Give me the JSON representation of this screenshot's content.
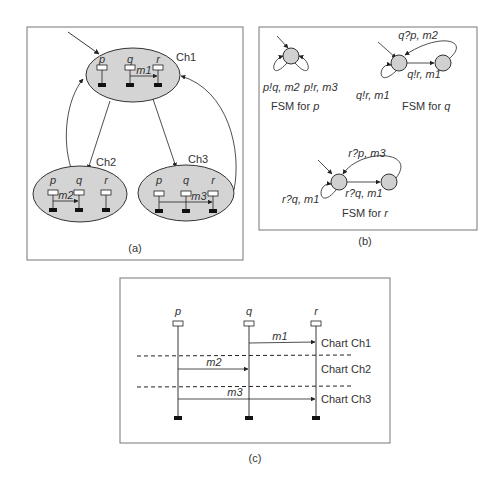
{
  "panel_a": {
    "caption": "(a)",
    "charts": [
      {
        "name": "Ch1",
        "lifelines": [
          "p",
          "q",
          "r"
        ],
        "message": "m1"
      },
      {
        "name": "Ch2",
        "lifelines": [
          "p",
          "q",
          "r"
        ],
        "message": "m2"
      },
      {
        "name": "Ch3",
        "lifelines": [
          "p",
          "q",
          "r"
        ],
        "message": "m3"
      }
    ]
  },
  "panel_b": {
    "caption": "(b)",
    "fsm_p": {
      "title_prefix": "FSM for ",
      "title_var": "p",
      "loop1": "p!q, m2",
      "loop2": "p!r, m3"
    },
    "fsm_q": {
      "title_prefix": "FSM for ",
      "title_var": "q",
      "loop": "q!r, m1",
      "forward": "q!r, m1",
      "back": "q?p, m2"
    },
    "fsm_r": {
      "title_prefix": "FSM for ",
      "title_var": "r",
      "loop": "r?q, m1",
      "forward": "r?q, m1",
      "back": "r?p, m3"
    }
  },
  "panel_c": {
    "caption": "(c)",
    "lifelines": [
      "p",
      "q",
      "r"
    ],
    "messages": [
      "m1",
      "m2",
      "m3"
    ],
    "chart_labels": [
      "Chart Ch1",
      "Chart Ch2",
      "Chart Ch3"
    ]
  },
  "colors": {
    "ellipse_fill": "#d4d4d4",
    "state_fill": "#d0d0d0",
    "stroke": "#333333",
    "frame": "#777777"
  }
}
